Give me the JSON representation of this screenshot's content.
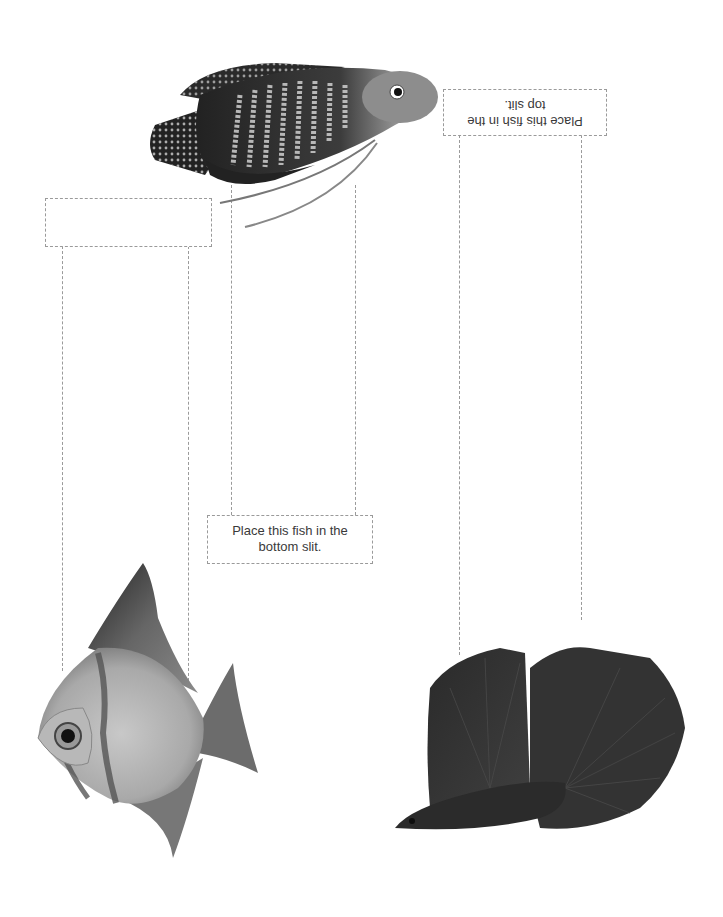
{
  "labels": {
    "top_slit": "Place this fish in the top slit.",
    "top_slit_line1": "Place this fish in the",
    "top_slit_line2": "top slit.",
    "bottom_slit_line1": "Place this fish in the",
    "bottom_slit_line2": "bottom slit."
  },
  "figures": [
    {
      "name": "gourami-fish",
      "tone": "dark striped"
    },
    {
      "name": "silver-dollar-fish",
      "tone": "silver with dark bands"
    },
    {
      "name": "betta-fish",
      "tone": "dark"
    }
  ],
  "colors": {
    "dash": "#9a9a9a",
    "text": "#3a3a3a",
    "background": "#ffffff"
  }
}
